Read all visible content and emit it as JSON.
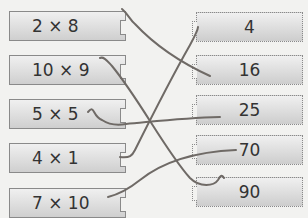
{
  "left_items": [
    {
      "label": "2 × 8"
    },
    {
      "label": "10 × 9"
    },
    {
      "label": "5 × 5"
    },
    {
      "label": "4 × 1"
    },
    {
      "label": "7 × 10"
    }
  ],
  "right_items": [
    {
      "label": "4"
    },
    {
      "label": "16"
    },
    {
      "label": "25"
    },
    {
      "label": "70"
    },
    {
      "label": "90"
    }
  ],
  "connections": [
    {
      "from": "2 × 8",
      "to": "16"
    },
    {
      "from": "10 × 9",
      "to": "90"
    },
    {
      "from": "5 × 5",
      "to": "25"
    },
    {
      "from": "4 × 1",
      "to": "4"
    },
    {
      "from": "7 × 10",
      "to": "70"
    }
  ],
  "colors": {
    "line": "#6f6a66",
    "box_border": "#8a8a8a"
  }
}
